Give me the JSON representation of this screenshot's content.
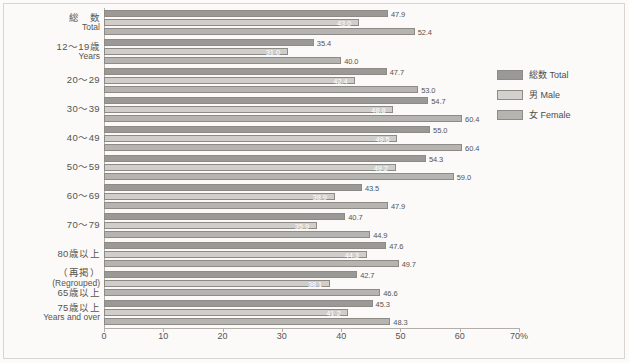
{
  "chart_data": {
    "type": "bar",
    "orientation": "horizontal",
    "title": "",
    "xlabel": "",
    "ylabel": "",
    "xlim": [
      0,
      70
    ],
    "xticks": [
      0,
      10,
      20,
      30,
      40,
      50,
      60,
      70
    ],
    "xtick_labels": [
      "0",
      "10",
      "20",
      "30",
      "40",
      "50",
      "60",
      "70%"
    ],
    "grid": false,
    "legend_position": "right",
    "categories": [
      {
        "ja": "総　数",
        "en": "Total"
      },
      {
        "ja": "12〜19歳",
        "en": "Years"
      },
      {
        "ja": "20〜29",
        "en": ""
      },
      {
        "ja": "30〜39",
        "en": ""
      },
      {
        "ja": "40〜49",
        "en": ""
      },
      {
        "ja": "50〜59",
        "en": ""
      },
      {
        "ja": "60〜69",
        "en": ""
      },
      {
        "ja": "70〜79",
        "en": ""
      },
      {
        "ja": "80歳以上",
        "en": ""
      },
      {
        "ja": "（再掲）\n65歳以上",
        "en": "(Regrouped)"
      },
      {
        "ja": "75歳以上",
        "en": "Years and over"
      }
    ],
    "series": [
      {
        "name": "総数 Total",
        "key": "total",
        "color": "#9a9995",
        "values": [
          47.9,
          35.4,
          47.7,
          54.7,
          55.0,
          54.3,
          43.5,
          40.7,
          47.6,
          42.7,
          45.3
        ]
      },
      {
        "name": "男 Male",
        "key": "male",
        "color": "#cfcecb",
        "values": [
          43.0,
          31.0,
          42.4,
          48.8,
          49.5,
          49.2,
          38.9,
          35.9,
          44.3,
          38.1,
          41.2
        ]
      },
      {
        "name": "女 Female",
        "key": "female",
        "color": "#b5b4b0",
        "values": [
          52.4,
          40.0,
          53.0,
          60.4,
          60.4,
          59.0,
          47.9,
          44.9,
          49.7,
          46.6,
          48.3
        ]
      }
    ]
  },
  "legend": {
    "items": [
      {
        "label": "総数 Total",
        "key": "total"
      },
      {
        "label": "男 Male",
        "key": "male"
      },
      {
        "label": "女 Female",
        "key": "female"
      }
    ]
  }
}
